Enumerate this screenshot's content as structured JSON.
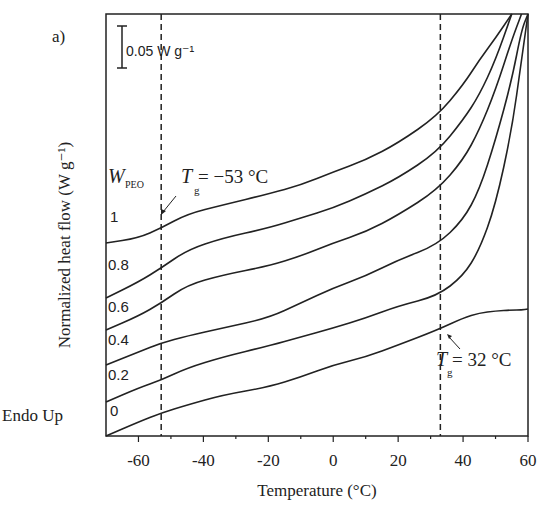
{
  "chart_data": {
    "type": "line",
    "panel_label": "a)",
    "title": "",
    "xlabel": "Temperature (°C)",
    "ylabel": "Normalized heat flow (W g⁻¹)",
    "xlim": [
      -70,
      60
    ],
    "xticks": [
      -60,
      -40,
      -20,
      0,
      20,
      40,
      60
    ],
    "xtick_labels": [
      "-60",
      "-40",
      "-20",
      "0",
      "20",
      "40",
      "60"
    ],
    "yticks": [],
    "grid": false,
    "scale_bar": {
      "label": "0.05 W g⁻¹",
      "value": 0.05
    },
    "endo_label": "Endo Up",
    "legend_title": "W",
    "legend_title_sub": "PEO",
    "series_x": [
      -70,
      -60,
      -53,
      -45,
      -34,
      -20,
      -10,
      0,
      10,
      20,
      32,
      40,
      45,
      50,
      55,
      58,
      60
    ],
    "series": [
      {
        "name": "1",
        "label": "1",
        "y_px": [
          243,
          238,
          228,
          214,
          205,
          194,
          185,
          172,
          160,
          143,
          116,
          85,
          60,
          38,
          14,
          null,
          null
        ]
      },
      {
        "name": "0.8",
        "label": "0.8",
        "y_px": [
          298,
          282,
          268,
          250,
          238,
          228,
          218,
          208,
          194,
          178,
          152,
          120,
          95,
          60,
          14,
          null,
          null
        ]
      },
      {
        "name": "0.6",
        "label": "0.6",
        "y_px": [
          330,
          316,
          303,
          285,
          275,
          266,
          256,
          243,
          232,
          215,
          190,
          160,
          130,
          90,
          40,
          14,
          null
        ]
      },
      {
        "name": "0.4",
        "label": "0.4",
        "y_px": [
          365,
          352,
          343,
          336,
          328,
          318,
          303,
          288,
          276,
          260,
          245,
          220,
          190,
          140,
          80,
          30,
          14
        ]
      },
      {
        "name": "0.2",
        "label": "0.2",
        "y_px": [
          402,
          388,
          380,
          368,
          357,
          346,
          337,
          328,
          318,
          306,
          296,
          276,
          250,
          205,
          130,
          60,
          14
        ]
      },
      {
        "name": "0",
        "label": "0",
        "y_px": [
          436,
          422,
          413,
          405,
          395,
          387,
          377,
          365,
          357,
          345,
          330,
          318,
          313,
          311,
          310,
          310,
          309
        ]
      }
    ],
    "annotations": [
      {
        "text_main": "T",
        "text_sub": "g",
        "text_rest": "= −53 °C",
        "x": -53
      },
      {
        "text_main": "T",
        "text_sub": "g",
        "text_rest": "= 32 °C",
        "x": 32
      }
    ],
    "vlines": [
      -53,
      33
    ]
  }
}
